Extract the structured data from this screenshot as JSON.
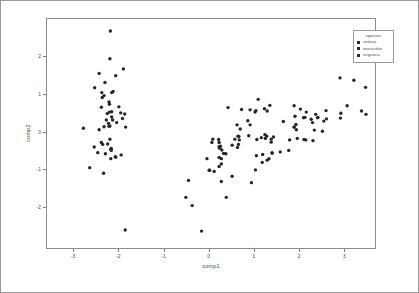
{
  "chart_data": {
    "type": "scatter",
    "title": "",
    "xlabel": "comp1",
    "ylabel": "comp2",
    "xlim": [
      -3.6,
      3.7
    ],
    "ylim": [
      -3.1,
      3.0
    ],
    "xticks": [
      -3,
      -2,
      -1,
      0,
      1,
      2,
      3
    ],
    "xticklabels": [
      "-3",
      "-2",
      "-1",
      "0",
      "1",
      "2",
      "3"
    ],
    "yticks": [
      -2,
      -1,
      0,
      1,
      2
    ],
    "yticklabels": [
      "-2",
      "-1",
      "0",
      "1",
      "2"
    ],
    "grid": false,
    "legend": {
      "title": "species",
      "position": "top-right",
      "entries": [
        {
          "label": "setosa",
          "color": "#2b2b2b",
          "marker": "square"
        },
        {
          "label": "versicolor",
          "color": "#2b2b2b",
          "marker": "square"
        },
        {
          "label": "virginica",
          "color": "#2b2b2b",
          "marker": "square"
        }
      ]
    },
    "marker_color": "#262626",
    "marker_size": 1.7,
    "series": [
      {
        "name": "setosa",
        "color": "#262626",
        "points": [
          [
            -2.26,
            0.48
          ],
          [
            -2.08,
            -0.67
          ],
          [
            -2.36,
            -0.34
          ],
          [
            -2.3,
            -0.59
          ],
          [
            -2.39,
            0.65
          ],
          [
            -2.07,
            1.49
          ],
          [
            -2.44,
            0.05
          ],
          [
            -2.23,
            0.22
          ],
          [
            -2.34,
            -1.11
          ],
          [
            -2.18,
            -0.47
          ],
          [
            -2.16,
            1.04
          ],
          [
            -2.33,
            0.13
          ],
          [
            -2.18,
            -0.72
          ],
          [
            -2.65,
            -0.96
          ],
          [
            -2.2,
            1.94
          ],
          [
            -2.19,
            2.68
          ],
          [
            -2.31,
            1.31
          ],
          [
            -2.21,
            0.52
          ],
          [
            -1.9,
            1.67
          ],
          [
            -2.33,
            0.96
          ],
          [
            -1.92,
            0.35
          ],
          [
            -2.21,
            0.73
          ],
          [
            -2.79,
            0.09
          ],
          [
            -1.85,
            0.12
          ],
          [
            -2.22,
            0.14
          ],
          [
            -1.95,
            -0.62
          ],
          [
            -2.05,
            0.24
          ],
          [
            -2.16,
            0.53
          ],
          [
            -2.14,
            0.31
          ],
          [
            -2.25,
            -0.33
          ],
          [
            -2.17,
            -0.5
          ],
          [
            -1.87,
            0.47
          ],
          [
            -2.54,
            1.17
          ],
          [
            -2.44,
            1.55
          ],
          [
            -2.17,
            -0.45
          ],
          [
            -2.2,
            -0.2
          ],
          [
            -2.0,
            0.66
          ],
          [
            -2.37,
            0.91
          ],
          [
            -2.47,
            -0.56
          ],
          [
            -2.16,
            0.39
          ],
          [
            -2.28,
            0.31
          ],
          [
            -1.86,
            -2.62
          ],
          [
            -2.55,
            -0.41
          ],
          [
            -1.96,
            0.5
          ],
          [
            -2.13,
            1.07
          ],
          [
            -2.07,
            -0.68
          ],
          [
            -2.38,
            1.04
          ],
          [
            -2.39,
            -0.29
          ],
          [
            -2.22,
            0.79
          ],
          [
            -2.2,
            0.15
          ]
        ]
      },
      {
        "name": "versicolor",
        "color": "#262626",
        "points": [
          [
            1.1,
            0.86
          ],
          [
            0.73,
            0.59
          ],
          [
            1.24,
            0.61
          ],
          [
            0.39,
            -1.75
          ],
          [
            1.07,
            -0.21
          ],
          [
            0.38,
            -0.59
          ],
          [
            1.3,
            0.55
          ],
          [
            -0.51,
            -1.75
          ],
          [
            0.92,
            0.18
          ],
          [
            0.01,
            -1.03
          ],
          [
            -0.16,
            -2.65
          ],
          [
            0.68,
            -0.22
          ],
          [
            0.28,
            -1.33
          ],
          [
            0.89,
            -0.11
          ],
          [
            0.23,
            -0.4
          ],
          [
            0.92,
            0.58
          ],
          [
            0.66,
            -0.34
          ],
          [
            0.23,
            -0.69
          ],
          [
            0.95,
            -1.36
          ],
          [
            0.23,
            -0.93
          ],
          [
            1.03,
            0.52
          ],
          [
            0.65,
            -0.12
          ],
          [
            1.19,
            -0.82
          ],
          [
            0.64,
            -0.42
          ],
          [
            0.7,
            0.07
          ],
          [
            0.87,
            0.29
          ],
          [
            1.25,
            -0.08
          ],
          [
            1.36,
            0.7
          ],
          [
            0.67,
            -0.13
          ],
          [
            -0.04,
            -0.72
          ],
          [
            0.12,
            -1.06
          ],
          [
            0.02,
            -1.03
          ],
          [
            0.24,
            -0.44
          ],
          [
            1.06,
            -0.64
          ],
          [
            0.22,
            -0.21
          ],
          [
            0.43,
            0.64
          ],
          [
            1.05,
            0.56
          ],
          [
            1.04,
            -1.02
          ],
          [
            0.07,
            -0.29
          ],
          [
            0.28,
            -0.86
          ],
          [
            0.28,
            -0.72
          ],
          [
            0.63,
            0.18
          ],
          [
            0.33,
            -0.58
          ],
          [
            -0.37,
            -1.97
          ],
          [
            0.29,
            -0.49
          ],
          [
            0.09,
            -0.2
          ],
          [
            0.23,
            -0.29
          ],
          [
            0.58,
            -0.2
          ],
          [
            -0.45,
            -1.3
          ],
          [
            0.26,
            -0.39
          ]
        ]
      },
      {
        "name": "virginica",
        "color": "#262626",
        "points": [
          [
            2.53,
            0.01
          ],
          [
            1.41,
            -0.57
          ],
          [
            2.62,
            0.34
          ],
          [
            1.97,
            -0.18
          ],
          [
            2.35,
            0.04
          ],
          [
            3.4,
            0.55
          ],
          [
            0.52,
            -1.19
          ],
          [
            2.93,
            0.36
          ],
          [
            2.32,
            -0.24
          ],
          [
            2.92,
            1.43
          ],
          [
            1.66,
            0.27
          ],
          [
            1.8,
            -0.22
          ],
          [
            2.17,
            0.52
          ],
          [
            1.34,
            -0.72
          ],
          [
            1.59,
            -0.54
          ],
          [
            1.9,
            0.69
          ],
          [
            1.95,
            0.05
          ],
          [
            3.49,
            1.18
          ],
          [
            3.79,
            0.26
          ],
          [
            1.3,
            -0.76
          ],
          [
            2.43,
            0.38
          ],
          [
            1.2,
            -0.61
          ],
          [
            3.5,
            0.46
          ],
          [
            1.39,
            -0.2
          ],
          [
            2.28,
            0.33
          ],
          [
            2.61,
            0.56
          ],
          [
            1.26,
            -0.18
          ],
          [
            1.29,
            -0.12
          ],
          [
            2.12,
            -0.21
          ],
          [
            2.38,
            0.46
          ],
          [
            2.94,
            0.49
          ],
          [
            3.23,
            1.37
          ],
          [
            2.16,
            -0.22
          ],
          [
            1.44,
            -0.14
          ],
          [
            1.78,
            -0.5
          ],
          [
            3.08,
            0.69
          ],
          [
            2.14,
            0.38
          ],
          [
            1.9,
            0.12
          ],
          [
            1.17,
            -0.16
          ],
          [
            2.11,
            0.37
          ],
          [
            2.31,
            0.24
          ],
          [
            1.92,
            0.41
          ],
          [
            1.41,
            -0.57
          ],
          [
            2.56,
            0.28
          ],
          [
            2.42,
            0.37
          ],
          [
            1.94,
            0.19
          ],
          [
            0.52,
            -0.36
          ],
          [
            1.9,
            0.12
          ],
          [
            2.04,
            0.6
          ],
          [
            1.39,
            -0.28
          ]
        ]
      }
    ]
  }
}
